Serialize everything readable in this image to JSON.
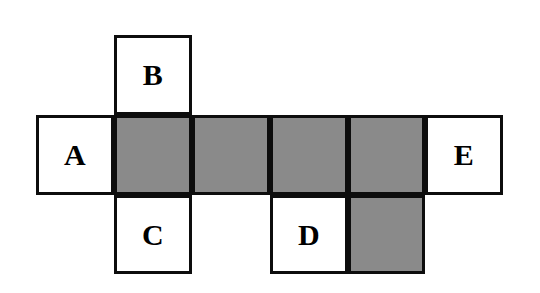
{
  "figure": {
    "type": "cube-net-diagram",
    "background_color": "#ffffff",
    "border_color": "#0d0d0d",
    "shaded_color": "#8a8a8a",
    "white_color": "#ffffff",
    "grid": {
      "column_edges_px": [
        36,
        114,
        192,
        270,
        348,
        425,
        503
      ],
      "row_edges_px": [
        35,
        115,
        195,
        274
      ],
      "columns": 6,
      "rows": 3
    },
    "cells": [
      {
        "id": "cell-b",
        "label": "B",
        "shaded": false,
        "col": 2,
        "row": 1,
        "x": 114,
        "y": 35,
        "w": 78,
        "h": 80
      },
      {
        "id": "cell-a",
        "label": "A",
        "shaded": false,
        "col": 1,
        "row": 2,
        "x": 36,
        "y": 115,
        "w": 78,
        "h": 80
      },
      {
        "id": "cell-r2c2",
        "label": "",
        "shaded": true,
        "col": 2,
        "row": 2,
        "x": 114,
        "y": 115,
        "w": 78,
        "h": 80
      },
      {
        "id": "cell-r2c3",
        "label": "",
        "shaded": true,
        "col": 3,
        "row": 2,
        "x": 192,
        "y": 115,
        "w": 78,
        "h": 80
      },
      {
        "id": "cell-r2c4",
        "label": "",
        "shaded": true,
        "col": 4,
        "row": 2,
        "x": 270,
        "y": 115,
        "w": 78,
        "h": 80
      },
      {
        "id": "cell-r2c5",
        "label": "",
        "shaded": true,
        "col": 5,
        "row": 2,
        "x": 348,
        "y": 115,
        "w": 77,
        "h": 80
      },
      {
        "id": "cell-e",
        "label": "E",
        "shaded": false,
        "col": 6,
        "row": 2,
        "x": 425,
        "y": 115,
        "w": 78,
        "h": 80
      },
      {
        "id": "cell-c",
        "label": "C",
        "shaded": false,
        "col": 2,
        "row": 3,
        "x": 114,
        "y": 195,
        "w": 78,
        "h": 79
      },
      {
        "id": "cell-d",
        "label": "D",
        "shaded": false,
        "col": 4,
        "row": 3,
        "x": 270,
        "y": 195,
        "w": 78,
        "h": 79
      },
      {
        "id": "cell-r3c5",
        "label": "",
        "shaded": true,
        "col": 5,
        "row": 3,
        "x": 348,
        "y": 195,
        "w": 77,
        "h": 79
      }
    ],
    "labels": [
      "A",
      "B",
      "C",
      "D",
      "E"
    ]
  }
}
